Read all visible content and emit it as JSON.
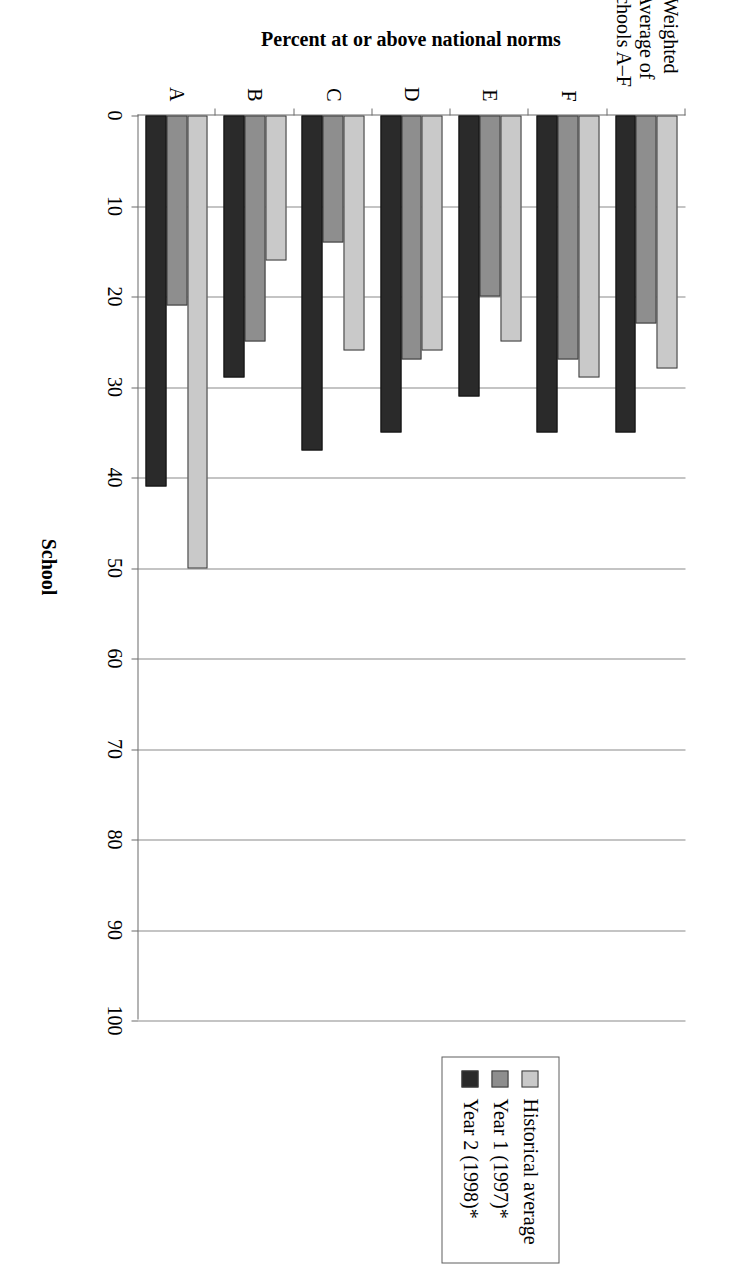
{
  "chart_data": {
    "type": "bar",
    "title": "",
    "xlabel": "School",
    "ylabel": "Percent at or above national norms",
    "ylim": [
      0,
      100
    ],
    "ytick_values": [
      0,
      10,
      20,
      30,
      40,
      50,
      60,
      70,
      80,
      90,
      100
    ],
    "ytick_labels": [
      "0",
      "10",
      "20",
      "30",
      "40",
      "50",
      "60",
      "70",
      "80",
      "90",
      "100"
    ],
    "grid": true,
    "orientation": "vertical-bars-rotated-page",
    "legend_position": "right",
    "categories": [
      "A",
      "B",
      "C",
      "D",
      "E",
      "F",
      "Weighted Average of Schools A–F"
    ],
    "series": [
      {
        "name": "Historical average",
        "color": "#c9c9c9",
        "values": [
          50,
          16,
          26,
          26,
          25,
          29,
          28
        ]
      },
      {
        "name": "Year 1 (1997)*",
        "color": "#8e8e8e",
        "values": [
          21,
          25,
          14,
          27,
          20,
          27,
          23
        ]
      },
      {
        "name": "Year 2 (1998)*",
        "color": "#2a2a2a",
        "values": [
          41,
          29,
          37,
          35,
          31,
          35,
          35
        ]
      }
    ]
  },
  "axis": {
    "y_title": "Percent at or above national norms",
    "x_title": "School"
  },
  "legend": {
    "items": [
      {
        "label": "Historical average",
        "swatch": "light-gray-swatch"
      },
      {
        "label": "Year 1 (1997)*",
        "swatch": "medium-gray-swatch"
      },
      {
        "label": "Year 2 (1998)*",
        "swatch": "dark-swatch"
      }
    ]
  }
}
